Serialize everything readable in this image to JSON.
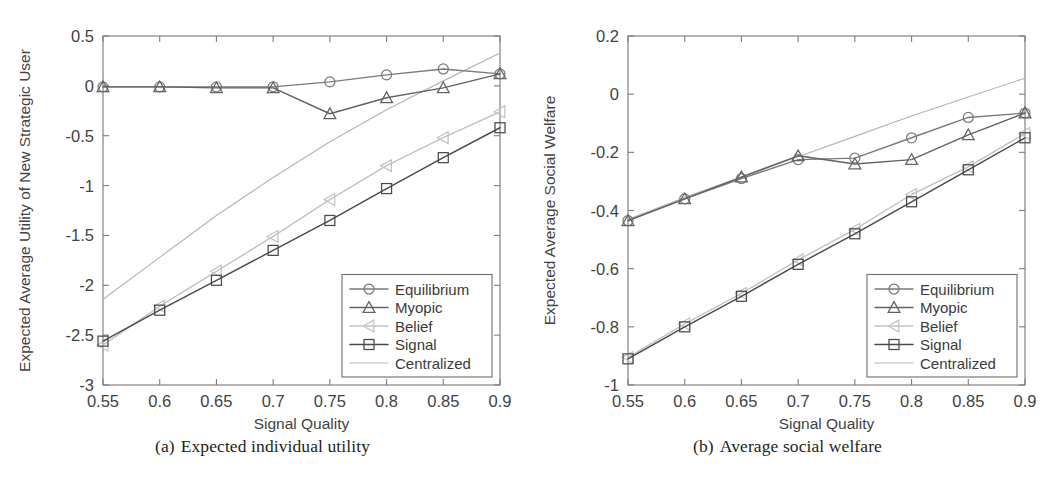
{
  "figure": {
    "panels": [
      {
        "id": "a",
        "caption_label": "(a)",
        "caption_text": "Expected individual utility",
        "xlabel": "Signal Quality",
        "ylabel": "Expected Average Utility of New Strategic User",
        "xticks": [
          "0.55",
          "0.6",
          "0.65",
          "0.7",
          "0.75",
          "0.8",
          "0.85",
          "0.9"
        ],
        "yticks": [
          "0.5",
          "0",
          "-0.5",
          "-1",
          "-1.5",
          "-2",
          "-2.5",
          "-3"
        ]
      },
      {
        "id": "b",
        "caption_label": "(b)",
        "caption_text": "Average social welfare",
        "xlabel": "Signal Quality",
        "ylabel": "Expected Average Social Welfare",
        "xticks": [
          "0.55",
          "0.6",
          "0.65",
          "0.7",
          "0.75",
          "0.8",
          "0.85",
          "0.9"
        ],
        "yticks": [
          "0.2",
          "0",
          "-0.2",
          "-0.4",
          "-0.6",
          "-0.8",
          "-1"
        ]
      }
    ],
    "legend": {
      "entries": [
        {
          "label": "Equilibrium",
          "marker": "circle-marker",
          "color": "#7a7a7a"
        },
        {
          "label": "Myopic",
          "marker": "triangle-up-marker",
          "color": "#636363"
        },
        {
          "label": "Belief",
          "marker": "triangle-left-marker",
          "color": "#c3c3c3"
        },
        {
          "label": "Signal",
          "marker": "square-marker",
          "color": "#4a4a4a"
        },
        {
          "label": "Centralized",
          "marker": "line-only-marker",
          "color": "#b5b5b5"
        }
      ]
    }
  },
  "chart_data": [
    {
      "type": "line",
      "panel": "a",
      "title": "Expected individual utility",
      "xlabel": "Signal Quality",
      "ylabel": "Expected Average Utility of New Strategic User",
      "x": [
        0.55,
        0.6,
        0.65,
        0.7,
        0.75,
        0.8,
        0.85,
        0.9
      ],
      "xlim": [
        0.55,
        0.9
      ],
      "ylim": [
        -3,
        0.5
      ],
      "yticks": [
        0.5,
        0,
        -0.5,
        -1,
        -1.5,
        -2,
        -2.5,
        -3
      ],
      "grid": false,
      "legend_position": "lower right",
      "series": [
        {
          "name": "Equilibrium",
          "color": "#7a7a7a",
          "marker": "circle",
          "values": [
            -0.01,
            -0.01,
            -0.01,
            -0.01,
            0.04,
            0.11,
            0.17,
            0.12
          ]
        },
        {
          "name": "Myopic",
          "color": "#636363",
          "marker": "triangle-up",
          "values": [
            -0.01,
            -0.01,
            -0.02,
            -0.02,
            -0.28,
            -0.12,
            -0.02,
            0.12
          ]
        },
        {
          "name": "Belief",
          "color": "#c3c3c3",
          "marker": "triangle-left",
          "values": [
            -2.6,
            -2.21,
            -1.86,
            -1.51,
            -1.14,
            -0.8,
            -0.52,
            -0.26
          ]
        },
        {
          "name": "Signal",
          "color": "#4a4a4a",
          "marker": "square",
          "values": [
            -2.56,
            -2.25,
            -1.95,
            -1.65,
            -1.35,
            -1.03,
            -0.72,
            -0.42
          ]
        },
        {
          "name": "Centralized",
          "color": "#b5b5b5",
          "marker": "none",
          "values": [
            -2.14,
            -1.72,
            -1.3,
            -0.92,
            -0.56,
            -0.24,
            0.05,
            0.33
          ]
        }
      ]
    },
    {
      "type": "line",
      "panel": "b",
      "title": "Average social welfare",
      "xlabel": "Signal Quality",
      "ylabel": "Expected Average Social Welfare",
      "x": [
        0.55,
        0.6,
        0.65,
        0.7,
        0.75,
        0.8,
        0.85,
        0.9
      ],
      "xlim": [
        0.55,
        0.9
      ],
      "ylim": [
        -1,
        0.2
      ],
      "yticks": [
        0.2,
        0,
        -0.2,
        -0.4,
        -0.6,
        -0.8,
        -1
      ],
      "grid": false,
      "legend_position": "lower right",
      "series": [
        {
          "name": "Equilibrium",
          "color": "#7a7a7a",
          "marker": "circle",
          "values": [
            -0.435,
            -0.36,
            -0.29,
            -0.225,
            -0.22,
            -0.15,
            -0.08,
            -0.065
          ]
        },
        {
          "name": "Myopic",
          "color": "#636363",
          "marker": "triangle-up",
          "values": [
            -0.435,
            -0.36,
            -0.285,
            -0.212,
            -0.24,
            -0.225,
            -0.14,
            -0.065
          ]
        },
        {
          "name": "Belief",
          "color": "#c3c3c3",
          "marker": "triangle-left",
          "values": [
            -0.905,
            -0.79,
            -0.685,
            -0.57,
            -0.465,
            -0.345,
            -0.25,
            -0.135
          ]
        },
        {
          "name": "Signal",
          "color": "#4a4a4a",
          "marker": "square",
          "values": [
            -0.91,
            -0.8,
            -0.695,
            -0.585,
            -0.48,
            -0.37,
            -0.26,
            -0.15
          ]
        },
        {
          "name": "Centralized",
          "color": "#b5b5b5",
          "marker": "none",
          "values": [
            -0.43,
            -0.355,
            -0.285,
            -0.215,
            -0.145,
            -0.075,
            -0.01,
            0.055
          ]
        }
      ]
    }
  ]
}
